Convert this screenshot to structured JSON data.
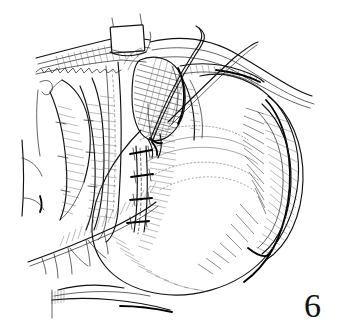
{
  "figure": {
    "number": "6",
    "caption_text": "6",
    "background_color": "#ffffff",
    "ink_color": "#111111",
    "width_px": 337,
    "height_px": 331,
    "style": "pen-and-ink line drawing with cross-hatch shading"
  },
  "parts": {
    "clamp": {
      "name": "retractor-clamp",
      "label": "white rectangular retractor"
    },
    "upper_fascia": {
      "name": "upper-fascia-flap",
      "label": "reflected fascial flap, upper left"
    },
    "shaded_pouch": {
      "name": "shaded-pouch",
      "label": "dark cross-hatched pouch / sac"
    },
    "suture_line": {
      "name": "suture-line",
      "label": "vertical sutured incision",
      "stitch_count": 4
    },
    "suture_thread_1": {
      "name": "suture-thread-upper",
      "label": "suture thread running to upper right"
    },
    "suture_thread_2": {
      "name": "suture-thread-lower",
      "label": "second suture thread running to upper right"
    },
    "large_mass": {
      "name": "large-organ-mass",
      "label": "large rounded organ body, right side"
    },
    "lateral_lobe": {
      "name": "lateral-lobe",
      "label": "crescent lobe along right margin"
    },
    "rib_structures": {
      "name": "rib-cartilage-group",
      "label": "rib / cartilage structures, left"
    },
    "vessel_branches": {
      "name": "vessel-branch-group",
      "label": "branching vessels, lower left"
    },
    "lower_tissue": {
      "name": "lower-tissue-edge",
      "label": "tissue edge at lower border"
    }
  }
}
